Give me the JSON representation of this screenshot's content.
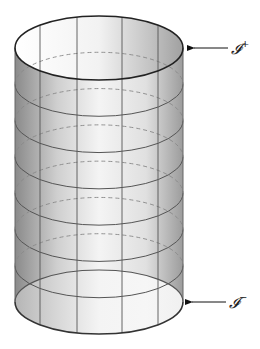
{
  "diagram": {
    "type": "cylinder",
    "cylinder": {
      "cx": 99,
      "rx": 84,
      "ry": 32,
      "top_cy": 48,
      "bottom_cy": 302,
      "ring_count": 8,
      "vertical_lines_x": [
        40,
        77,
        122,
        158
      ],
      "fill_gradient": [
        "#8a8a8a",
        "#d0d0d0",
        "#f4f4f4",
        "#e2e2e2",
        "#9a9a9a"
      ],
      "line_color": "#555555",
      "dashed_color": "#888888"
    },
    "labels": {
      "top": {
        "text": "𝓘",
        "sup": "+",
        "arrow_from_x": 228,
        "arrow_to_x": 192,
        "y": 48
      },
      "bottom": {
        "text": "𝓘",
        "sup": "−",
        "arrow_from_x": 226,
        "arrow_to_x": 190,
        "y": 302
      }
    }
  }
}
